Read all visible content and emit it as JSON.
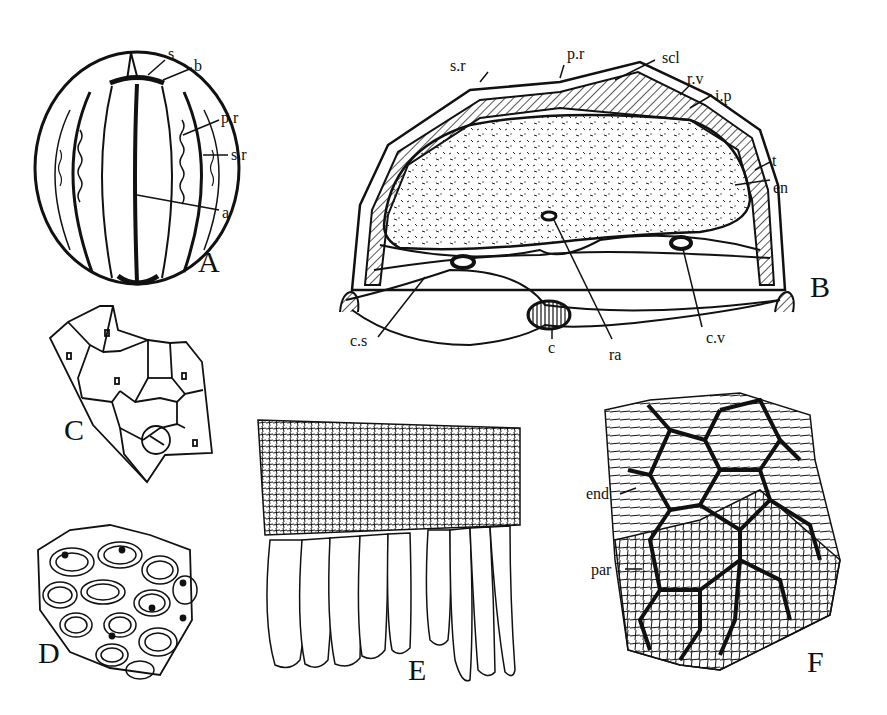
{
  "figure": {
    "panels": [
      {
        "id": "A",
        "label": "A",
        "annotations": [
          "s",
          "b",
          "p.r",
          "s.r",
          "a"
        ]
      },
      {
        "id": "B",
        "label": "B",
        "annotations": [
          "s.r",
          "p.r",
          "scl",
          "r.v",
          "i.p",
          "t",
          "en",
          "c.s",
          "c",
          "ra",
          "c.v"
        ]
      },
      {
        "id": "C",
        "label": "C",
        "annotations": []
      },
      {
        "id": "D",
        "label": "D",
        "annotations": []
      },
      {
        "id": "E",
        "label": "E",
        "annotations": []
      },
      {
        "id": "F",
        "label": "F",
        "annotations": [
          "end",
          "par"
        ]
      }
    ]
  },
  "labels": {
    "A": {
      "panel": "A",
      "s": "s",
      "b": "b",
      "pr": "p.r",
      "sr": "s.r",
      "a": "a"
    },
    "B": {
      "panel": "B",
      "sr": "s.r",
      "pr": "p.r",
      "scl": "scl",
      "rv": "r.v",
      "ip": "i.p",
      "t": "t",
      "en": "en",
      "cs": "c.s",
      "c": "c",
      "ra": "ra",
      "cv": "c.v"
    },
    "C": {
      "panel": "C"
    },
    "D": {
      "panel": "D"
    },
    "E": {
      "panel": "E"
    },
    "F": {
      "panel": "F",
      "end": "end",
      "par": "par"
    }
  }
}
